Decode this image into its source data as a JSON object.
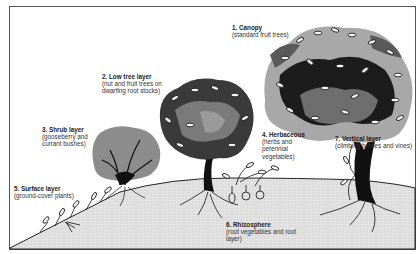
{
  "diagram": {
    "colors": {
      "frame": "#555555",
      "ground": "#d9d9d9",
      "canopy_dark": "#1a1a1a",
      "canopy_mid": "#6e6e6e",
      "canopy_light": "#a8a8a8",
      "leaf": "#f2f2f2"
    },
    "layers": [
      {
        "number": "1",
        "title": "1. Canopy",
        "desc": "(standard fruit trees)"
      },
      {
        "number": "2",
        "title": "2. Low tree layer",
        "desc_lines": [
          "(nut and fruit trees on",
          "dwarfing root stocks)"
        ]
      },
      {
        "number": "3",
        "title": "3. Shrub layer",
        "desc_lines": [
          "(gooseberry and",
          "currant bushes)"
        ]
      },
      {
        "number": "4",
        "title": "4. Herbaceous",
        "desc_lines": [
          "(herbs and",
          "perennial",
          "vegetables)"
        ]
      },
      {
        "number": "5",
        "title": "5. Surface layer",
        "desc": "(ground-cover plants)"
      },
      {
        "number": "6",
        "title": "6. Rhizosphere",
        "desc_lines": [
          "(root vegetables and root",
          "layer)"
        ]
      },
      {
        "number": "7",
        "title": "7. Vertical layer",
        "desc": "(climbing berries and vines)"
      }
    ]
  }
}
